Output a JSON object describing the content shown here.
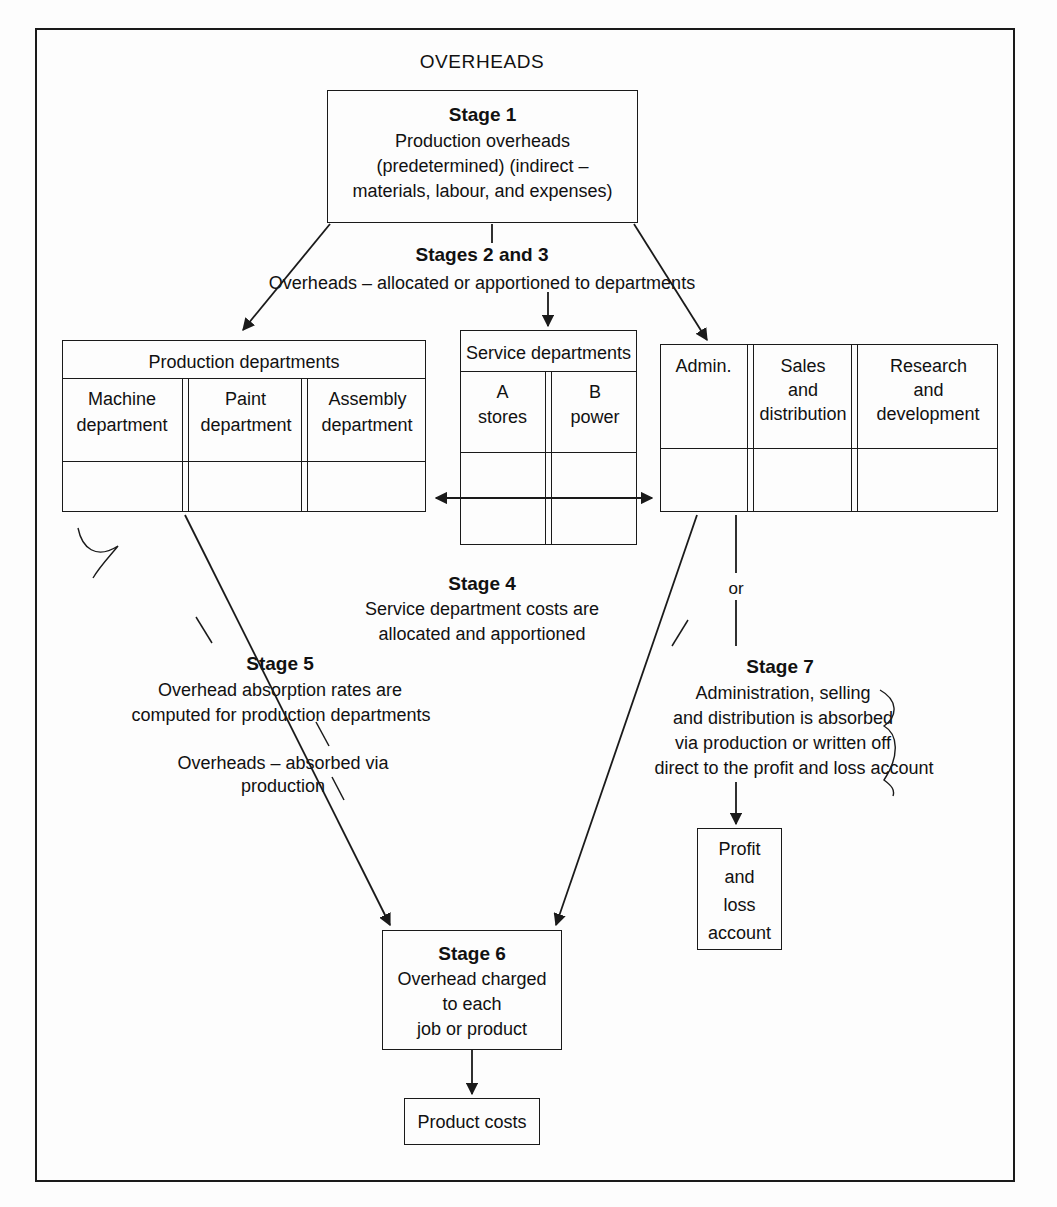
{
  "diagram": {
    "title": "OVERHEADS",
    "type": "flowchart",
    "stage1": {
      "heading": "Stage 1",
      "line1": "Production overheads",
      "line2": "(predetermined) (indirect –",
      "line3": "materials, labour, and expenses)"
    },
    "stages23": {
      "heading": "Stages 2 and 3",
      "line1": "Overheads – allocated or apportioned to departments"
    },
    "production_departments": {
      "header": "Production departments",
      "columns": [
        {
          "line1": "Machine",
          "line2": "department"
        },
        {
          "line1": "Paint",
          "line2": "department"
        },
        {
          "line1": "Assembly",
          "line2": "department"
        }
      ]
    },
    "service_departments": {
      "header": "Service departments",
      "columns": [
        {
          "line1": "A",
          "line2": "stores"
        },
        {
          "line1": "B",
          "line2": "power"
        }
      ]
    },
    "other_departments": {
      "columns": [
        {
          "line1": "Admin.",
          "line2": "",
          "line3": ""
        },
        {
          "line1": "Sales",
          "line2": "and",
          "line3": "distribution"
        },
        {
          "line1": "Research",
          "line2": "and",
          "line3": "development"
        }
      ]
    },
    "stage4": {
      "heading": "Stage 4",
      "line1": "Service department costs are",
      "line2": "allocated and apportioned"
    },
    "stage5": {
      "heading": "Stage 5",
      "line1": "Overhead absorption rates are",
      "line2": "computed for production departments",
      "line3": "Overheads – absorbed via production"
    },
    "stage7": {
      "heading": "Stage 7",
      "line1": "Administration, selling",
      "line2": "and distribution is absorbed",
      "line3": "via production or written off",
      "line4": "direct to the profit and loss account"
    },
    "stage6": {
      "heading": "Stage 6",
      "line1": "Overhead charged",
      "line2": "to each",
      "line3": "job or product"
    },
    "or_label": "or",
    "profit_loss": {
      "line1": "Profit",
      "line2": "and",
      "line3": "loss",
      "line4": "account"
    },
    "product_costs": {
      "label": "Product costs"
    }
  }
}
